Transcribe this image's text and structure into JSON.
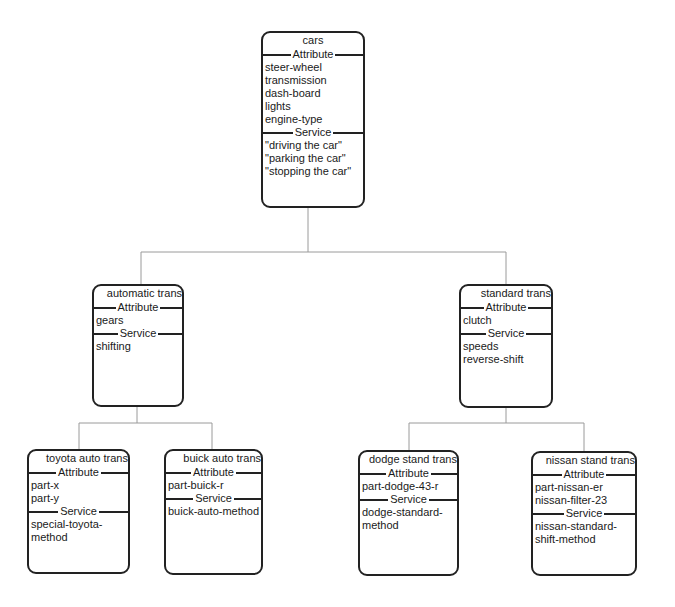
{
  "diagram": {
    "type": "class-hierarchy",
    "section_labels": {
      "attribute": "Attribute",
      "service": "Service"
    },
    "nodes": {
      "cars": {
        "name": "cars",
        "attributes": [
          "steer-wheel",
          "transmission",
          "dash-board",
          "lights",
          "engine-type"
        ],
        "services": [
          "\"driving the car\"",
          "\"parking the car\"",
          "\"stopping the car\""
        ]
      },
      "automatic": {
        "name": "automatic trans",
        "attributes": [
          "gears"
        ],
        "services": [
          "shifting"
        ]
      },
      "standard": {
        "name": "standard trans",
        "attributes": [
          "clutch"
        ],
        "services": [
          "speeds",
          "reverse-shift"
        ]
      },
      "toyota": {
        "name": "toyota auto trans",
        "attributes": [
          "part-x",
          "part-y"
        ],
        "services": [
          "special-toyota-",
          "method"
        ]
      },
      "buick": {
        "name": "buick auto trans",
        "attributes": [
          "part-buick-r"
        ],
        "services": [
          "buick-auto-method"
        ]
      },
      "dodge": {
        "name": "dodge stand trans",
        "attributes": [
          "part-dodge-43-r"
        ],
        "services": [
          "dodge-standard-",
          "method"
        ]
      },
      "nissan": {
        "name": "nissan stand trans",
        "attributes": [
          "part-nissan-er",
          "nissan-filter-23"
        ],
        "services": [
          "nissan-standard-",
          "shift-method"
        ]
      }
    },
    "edges": [
      [
        "cars",
        "automatic"
      ],
      [
        "cars",
        "standard"
      ],
      [
        "automatic",
        "toyota"
      ],
      [
        "automatic",
        "buick"
      ],
      [
        "standard",
        "dodge"
      ],
      [
        "standard",
        "nissan"
      ]
    ]
  }
}
